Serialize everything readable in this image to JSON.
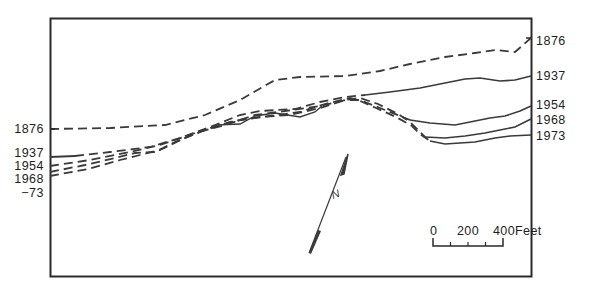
{
  "figure": {
    "type": "shoreline-change map",
    "frame": {
      "left": 50,
      "top": 18,
      "right": 531,
      "bottom": 276
    }
  },
  "left_labels": [
    {
      "text": "1876",
      "y": 129
    },
    {
      "text": "1937",
      "y": 153
    },
    {
      "text": "1954",
      "y": 166
    },
    {
      "text": "1968",
      "y": 179
    },
    {
      "text": "−73",
      "y": 192
    }
  ],
  "right_labels": [
    {
      "text": "1876",
      "y": 41
    },
    {
      "text": "1937",
      "y": 76
    },
    {
      "text": "1954",
      "y": 105
    },
    {
      "text": "1968",
      "y": 120
    },
    {
      "text": "1973",
      "y": 136
    }
  ],
  "shorelines": [
    {
      "year": "1876",
      "style": "dashed"
    },
    {
      "year": "1937",
      "style": "dashed-then-solid"
    },
    {
      "year": "1954",
      "style": "dashed-then-solid"
    },
    {
      "year": "1968",
      "style": "dashed-then-solid"
    },
    {
      "year": "1973",
      "style": "dashed-then-solid"
    }
  ],
  "north_arrow": {
    "label": "N",
    "icon": "north-arrow-icon"
  },
  "scale_bar": {
    "ticks": [
      "0",
      "200",
      "400"
    ],
    "unit": "Feet",
    "label_0": "0",
    "label_200": "200",
    "label_400": "400Feet"
  },
  "colors": {
    "line": "#3a3a3a",
    "frame": "#2a2a2a",
    "text": "#1e1e1e"
  }
}
